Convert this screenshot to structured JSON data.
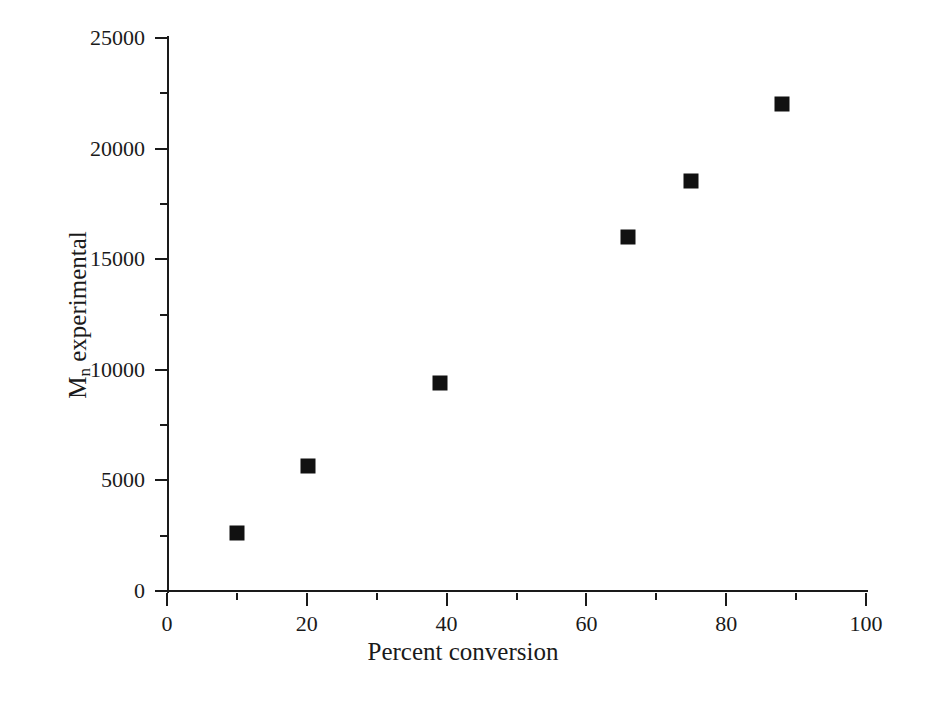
{
  "chart_data": {
    "type": "scatter",
    "title": "",
    "xlabel": "Percent conversion",
    "ylabel_main": "M",
    "ylabel_sub": "n",
    "ylabel_rest": " experimental",
    "ylabel": "Mn experimental",
    "xlim": [
      0,
      100
    ],
    "ylim": [
      0,
      25000
    ],
    "grid": false,
    "legend": "none",
    "x_major_ticks": [
      0,
      20,
      40,
      60,
      80,
      100
    ],
    "x_minor_ticks": [
      10,
      30,
      50,
      70,
      90
    ],
    "x_tick_labels": [
      "0",
      "20",
      "40",
      "60",
      "80",
      "100"
    ],
    "y_major_ticks": [
      0,
      5000,
      10000,
      15000,
      20000,
      25000
    ],
    "y_minor_ticks": [
      2500,
      7500,
      12500,
      17500,
      22500
    ],
    "y_tick_labels": [
      "0",
      "5000",
      "10000",
      "15000",
      "20000",
      "25000"
    ],
    "marker_shape": "square",
    "marker_color": "#111111",
    "axis_color": "#1a1a1a",
    "background_color": "#ffffff",
    "x": [
      10.0,
      20.2,
      39.0,
      66.0,
      75.0,
      88.0
    ],
    "y": [
      2600,
      5650,
      9400,
      16000,
      18550,
      22000
    ],
    "points": [
      {
        "x": 10.0,
        "y": 2600
      },
      {
        "x": 20.2,
        "y": 5650
      },
      {
        "x": 39.0,
        "y": 9400
      },
      {
        "x": 66.0,
        "y": 16000
      },
      {
        "x": 75.0,
        "y": 18550
      },
      {
        "x": 88.0,
        "y": 22000
      }
    ]
  }
}
